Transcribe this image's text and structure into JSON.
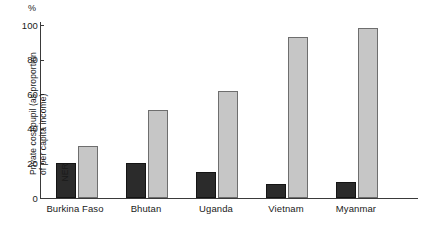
{
  "chart_data": {
    "type": "bar",
    "title": "",
    "xlabel": "",
    "ylabel": "%",
    "unit_symbol": "%",
    "ylim": [
      0,
      100
    ],
    "yticks": [
      0,
      20,
      40,
      60,
      80,
      100
    ],
    "grid": false,
    "legend_position": "in-plot-rotated",
    "categories": [
      "Burkina Faso",
      "Bhutan",
      "Uganda",
      "Vietnam",
      "Myanmar"
    ],
    "series": [
      {
        "name": "Private cost/pupil (as proportion of per capita income)",
        "name_line1": "Private cost/pupil (as proportion",
        "name_line2": "of per capita income)",
        "color": "#2b2b2b",
        "values": [
          20,
          20,
          15,
          8,
          9
        ]
      },
      {
        "name": "NER",
        "name_line1": "NER",
        "name_line2": "",
        "color": "#c6c6c6",
        "values": [
          30,
          51,
          62,
          93,
          98
        ]
      }
    ]
  }
}
